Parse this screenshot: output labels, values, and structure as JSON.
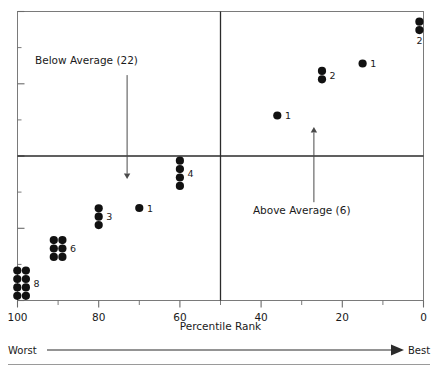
{
  "chart_data": {
    "type": "scatter",
    "title": "",
    "xlabel": "Percentile Rank",
    "ylabel": "",
    "xlim": [
      100,
      0
    ],
    "ylim": [
      0,
      100
    ],
    "x_axis_reversed": true,
    "grid": false,
    "legend_position": "none",
    "xticks": [
      100,
      80,
      60,
      40,
      20,
      0
    ],
    "xtick_labels": [
      "100",
      "80",
      "60",
      "40",
      "20",
      "0"
    ],
    "xminor_ticks": [
      90,
      70,
      50,
      30,
      10
    ],
    "yticks_labeled": false,
    "ytick_count": 9,
    "reference_lines": [
      {
        "name": "vertical-median-line",
        "orientation": "vertical",
        "value": 50
      },
      {
        "name": "horizontal-average-line",
        "orientation": "horizontal",
        "value": 50
      }
    ],
    "points": [
      {
        "label": "8",
        "count": 8,
        "x": 99,
        "y": 6,
        "cols": 2,
        "rows": 4,
        "label_side": "right"
      },
      {
        "label": "6",
        "count": 6,
        "x": 90,
        "y": 18,
        "cols": 2,
        "rows": 3,
        "label_side": "right"
      },
      {
        "label": "3",
        "count": 3,
        "x": 80,
        "y": 29,
        "cols": 1,
        "rows": 3,
        "label_side": "right"
      },
      {
        "label": "1",
        "count": 1,
        "x": 70,
        "y": 32,
        "cols": 1,
        "rows": 1,
        "label_side": "right"
      },
      {
        "label": "4",
        "count": 4,
        "x": 60,
        "y": 44,
        "cols": 1,
        "rows": 4,
        "label_side": "right"
      },
      {
        "label": "1",
        "count": 1,
        "x": 36,
        "y": 64,
        "cols": 1,
        "rows": 1,
        "label_side": "right"
      },
      {
        "label": "2",
        "count": 2,
        "x": 25,
        "y": 78,
        "cols": 1,
        "rows": 2,
        "label_side": "right"
      },
      {
        "label": "1",
        "count": 1,
        "x": 15,
        "y": 82,
        "cols": 1,
        "rows": 1,
        "label_side": "right"
      },
      {
        "label": "2",
        "count": 2,
        "x": 1,
        "y": 95,
        "cols": 1,
        "rows": 2,
        "label_side": "below"
      }
    ],
    "annotations": [
      {
        "name": "below-average-annotation",
        "text": "Below Average (22)",
        "arrow_direction": "down",
        "text_x": 83,
        "text_y": 82,
        "arrow_x": 73,
        "arrow_from_y": 78,
        "arrow_to_y": 42
      },
      {
        "name": "above-average-annotation",
        "text": "Above Average (6)",
        "arrow_direction": "up",
        "text_x": 30,
        "text_y": 30,
        "arrow_x": 27,
        "arrow_from_y": 34,
        "arrow_to_y": 60
      }
    ],
    "direction_scale": {
      "worst_label": "Worst",
      "best_label": "Best"
    },
    "colors": {
      "point": "#111111",
      "axis": "#6b6b6b",
      "reference_line": "#2b2b2b",
      "annotation_arrow": "#4a4a4a",
      "text": "#1a1a1a",
      "rule": "#9a9a9a"
    }
  }
}
